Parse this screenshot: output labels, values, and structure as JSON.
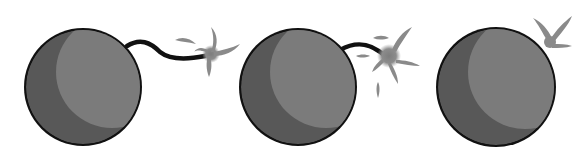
{
  "image": {
    "description": "Three cartoon bombs in a row with lit fuses and sparks, grayscale illustration",
    "background": "#ffffff"
  },
  "colors": {
    "outline": "#111111",
    "body_shadow": "#585858",
    "body_highlight": "#7b7b7b",
    "spark": "#8a8a8a"
  },
  "bombs": [
    {
      "label": "bomb-1",
      "cx": 83,
      "cy": 87,
      "r": 59,
      "fuse": "M127,46 C140,38 150,42 160,52 C170,60 185,60 205,56",
      "spark": {
        "cx": 212,
        "cy": 52
      }
    },
    {
      "label": "bomb-2",
      "cx": 298,
      "cy": 87,
      "r": 59,
      "fuse": "M340,50 C358,40 372,44 385,56",
      "spark": {
        "cx": 388,
        "cy": 56
      }
    },
    {
      "label": "bomb-3",
      "cx": 496,
      "cy": 87,
      "r": 60,
      "fuse": "",
      "spark": {
        "cx": 550,
        "cy": 36
      }
    }
  ]
}
